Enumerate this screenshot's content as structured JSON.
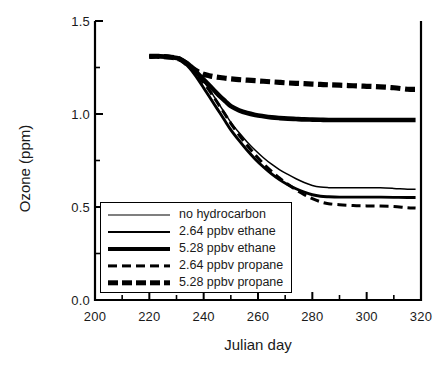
{
  "chart_data": {
    "type": "line",
    "title": "",
    "xlabel": "Julian day",
    "ylabel": "Ozone (ppm)",
    "xlim": [
      200,
      320
    ],
    "ylim": [
      0.0,
      1.5
    ],
    "grid": false,
    "legend_position": "lower-left-inside",
    "xticks": [
      200,
      220,
      240,
      260,
      280,
      300,
      320
    ],
    "xtick_labels": [
      "200",
      "220",
      "240",
      "260",
      "280",
      "300",
      "320"
    ],
    "xminor_step": 10,
    "yticks": [
      0.0,
      0.5,
      1.0,
      1.5
    ],
    "ytick_labels": [
      "0.0",
      "0.5",
      "1.0",
      "1.5"
    ],
    "yminor_step": 0.25,
    "x": [
      220,
      224,
      228,
      231,
      234,
      236,
      238,
      240,
      242,
      244,
      246,
      248,
      250,
      253,
      256,
      259,
      262,
      265,
      268,
      271,
      274,
      277,
      280,
      283,
      286,
      290,
      295,
      300,
      305,
      310,
      315,
      318
    ],
    "series": [
      {
        "name": "no hydrocarbon",
        "style": "solid",
        "width": "thin",
        "values": [
          1.31,
          1.31,
          1.305,
          1.3,
          1.275,
          1.245,
          1.21,
          1.175,
          1.135,
          1.09,
          1.045,
          1.0,
          0.955,
          0.9,
          0.85,
          0.805,
          0.765,
          0.73,
          0.7,
          0.675,
          0.652,
          0.632,
          0.616,
          0.607,
          0.604,
          0.603,
          0.603,
          0.603,
          0.603,
          0.6,
          0.596,
          0.596
        ]
      },
      {
        "name": "2.64 ppbv ethane",
        "style": "solid",
        "width": "medium",
        "values": [
          1.31,
          1.31,
          1.305,
          1.295,
          1.26,
          1.225,
          1.185,
          1.14,
          1.095,
          1.05,
          1.005,
          0.96,
          0.915,
          0.858,
          0.805,
          0.757,
          0.715,
          0.678,
          0.646,
          0.62,
          0.598,
          0.58,
          0.566,
          0.558,
          0.555,
          0.553,
          0.553,
          0.553,
          0.553,
          0.552,
          0.551,
          0.551
        ]
      },
      {
        "name": "5.28 ppbv ethane",
        "style": "solid",
        "width": "thick",
        "values": [
          1.31,
          1.31,
          1.305,
          1.298,
          1.272,
          1.245,
          1.215,
          1.185,
          1.155,
          1.125,
          1.095,
          1.068,
          1.042,
          1.02,
          1.005,
          0.995,
          0.988,
          0.982,
          0.978,
          0.975,
          0.973,
          0.971,
          0.97,
          0.969,
          0.968,
          0.968,
          0.968,
          0.968,
          0.968,
          0.968,
          0.968,
          0.968
        ]
      },
      {
        "name": "2.64 ppbv propane",
        "style": "dashed",
        "width": "dash-thin",
        "values": [
          1.31,
          1.31,
          1.305,
          1.298,
          1.268,
          1.238,
          1.205,
          1.168,
          1.128,
          1.085,
          1.04,
          0.995,
          0.95,
          0.888,
          0.832,
          0.78,
          0.733,
          0.692,
          0.655,
          0.622,
          0.592,
          0.566,
          0.545,
          0.528,
          0.518,
          0.512,
          0.508,
          0.506,
          0.505,
          0.503,
          0.496,
          0.494
        ]
      },
      {
        "name": "5.28 ppbv propane",
        "style": "dashed",
        "width": "dash-thick",
        "values": [
          1.31,
          1.31,
          1.305,
          1.296,
          1.268,
          1.245,
          1.227,
          1.214,
          1.206,
          1.2,
          1.196,
          1.192,
          1.189,
          1.185,
          1.182,
          1.179,
          1.176,
          1.173,
          1.17,
          1.167,
          1.165,
          1.163,
          1.161,
          1.159,
          1.157,
          1.155,
          1.152,
          1.149,
          1.146,
          1.141,
          1.133,
          1.132
        ]
      }
    ]
  },
  "legend": {
    "entries": [
      {
        "label": "no hydrocarbon"
      },
      {
        "label": "2.64 ppbv ethane"
      },
      {
        "label": "5.28 ppbv ethane"
      },
      {
        "label": "2.64 ppbv propane"
      },
      {
        "label": "5.28 ppbv propane"
      }
    ]
  }
}
